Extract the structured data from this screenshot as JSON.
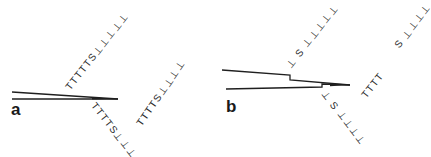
{
  "figure": {
    "panels": [
      {
        "label": "a",
        "lines": "two converging strands meeting at a point",
        "strands": [
          {
            "name": "upper-left-strand",
            "sequence": [
              "T",
              "T",
              "T",
              "T",
              "T",
              "S",
              "⊥",
              "⊥",
              "⊥",
              "⊥",
              "⊥"
            ]
          },
          {
            "name": "lower-strand",
            "sequence": [
              "T",
              "T",
              "T",
              "T",
              "S",
              "⊥",
              "⊥",
              "⊥",
              "⊥"
            ]
          },
          {
            "name": "right-strand",
            "sequence": [
              "T",
              "T",
              "T",
              "T",
              "S",
              "⊥",
              "⊥",
              "⊥",
              "⊥"
            ]
          }
        ]
      },
      {
        "label": "b",
        "lines": "two strands with stepped offsets converging at a point",
        "strands": [
          {
            "name": "upper-strand",
            "sequence": [
              "⊥",
              "S",
              "⊥",
              "⊥",
              "⊥",
              "⊥",
              "⊥"
            ]
          },
          {
            "name": "lower-strand",
            "sequence": [
              "⊥",
              "S",
              "⊥",
              "⊥",
              "⊥",
              "⊥"
            ]
          },
          {
            "name": "right-t-strand",
            "sequence": [
              "T",
              "T",
              "T",
              "T"
            ]
          },
          {
            "name": "far-right-strand",
            "sequence": [
              "S",
              "⊥",
              "⊥",
              "⊥",
              "⊥"
            ]
          }
        ]
      }
    ],
    "text": {
      "a_up": "TTTTTS⊥⊥⊥⊥⊥",
      "a_down": "TTTTS⊥⊥⊥⊥",
      "a_right": "TTTTS⊥⊥⊥⊥",
      "b_up": "⊥ S ⊥⊥⊥⊥⊥",
      "b_down": "⊥ S ⊥⊥⊥⊥",
      "b_right_t": "TTTT",
      "b_far": "S ⊥⊥⊥⊥"
    }
  }
}
